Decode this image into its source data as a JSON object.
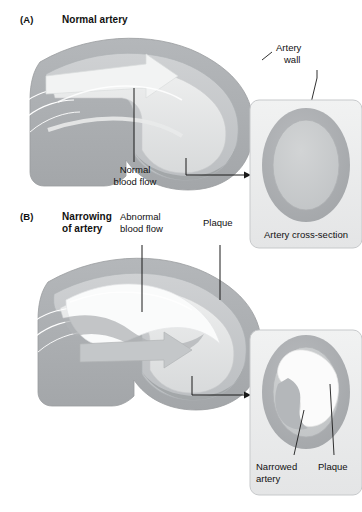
{
  "figure": {
    "width": 362,
    "height": 512,
    "background_color": "#ffffff"
  },
  "colors": {
    "wall_outer": "#a8abae",
    "wall_mid": "#b9bcbf",
    "wall_inner": "#c6c9cb",
    "lumen_light": "#dfe1e2",
    "lumen_white": "#f3f4f4",
    "plaque": "#fbfbfb",
    "box_fill": "#eceded",
    "box_stroke": "#c2c4c6",
    "line": "#1a1a1a",
    "text": "#111111"
  },
  "panels": [
    {
      "id": "A",
      "letter": "(A)",
      "title": "Normal artery",
      "callouts": [
        {
          "name": "artery-wall",
          "label_line1": "Artery",
          "label_line2": "wall"
        },
        {
          "name": "normal-blood-flow",
          "label_line1": "Normal",
          "label_line2": "blood flow"
        }
      ],
      "inset": {
        "caption": "Artery cross-section",
        "name": "artery-cross-section-normal"
      }
    },
    {
      "id": "B",
      "letter": "(B)",
      "title_line1": "Narrowing",
      "title_line2": "of artery",
      "callouts": [
        {
          "name": "abnormal-blood-flow",
          "label_line1": "Abnormal",
          "label_line2": "blood flow"
        },
        {
          "name": "plaque",
          "label_line1": "Plaque",
          "label_line2": ""
        }
      ],
      "inset": {
        "name": "artery-cross-section-narrowed",
        "labels": [
          {
            "name": "narrowed-artery",
            "line1": "Narrowed",
            "line2": "artery"
          },
          {
            "name": "plaque-inset",
            "line1": "Plaque",
            "line2": ""
          }
        ]
      }
    }
  ]
}
